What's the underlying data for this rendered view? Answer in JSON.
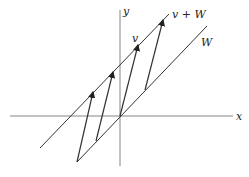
{
  "diagram": {
    "title": "",
    "labels": {
      "x_axis": "x",
      "y_axis": "y",
      "line_w": "W",
      "line_v_plus_w": "v + W",
      "vector_v": "v"
    },
    "colors": {
      "stroke": "#222222",
      "background": "#ffffff"
    },
    "arrow_count": 4
  }
}
